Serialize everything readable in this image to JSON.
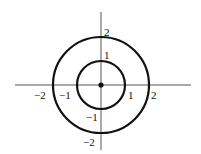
{
  "diagram": {
    "center": {
      "x": 0,
      "y": 0,
      "marker": "filled-dot"
    },
    "circles": [
      {
        "name": "inner-circle",
        "radius": 1
      },
      {
        "name": "outer-circle",
        "radius": 2
      }
    ],
    "colors": {
      "stroke": "#111111",
      "axis": "#555555",
      "background": "#ffffff"
    },
    "labels": {
      "x_neg2": "−2",
      "x_neg1": "−1",
      "x_pos1": "1",
      "x_pos2": "2",
      "y_pos2": "2",
      "y_pos1": "1",
      "y_neg1": "−1",
      "y_neg2": "−2"
    }
  }
}
